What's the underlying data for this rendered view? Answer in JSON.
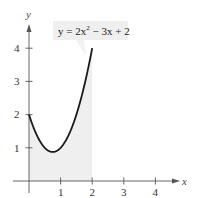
{
  "chart_data": {
    "type": "area",
    "title": "",
    "equation_label": "y = 2x² − 3x + 2",
    "function": "y = 2x^2 - 3x + 2",
    "shaded_region": {
      "x_from": 0,
      "x_to": 2,
      "description": "area under curve from x=0 to x=2"
    },
    "xlabel": "x",
    "ylabel": "y",
    "xlim": [
      0,
      4.6
    ],
    "ylim": [
      0,
      4.5
    ],
    "x_ticks": [
      1,
      2,
      3,
      4
    ],
    "y_ticks": [
      1,
      2,
      3,
      4
    ],
    "grid": false,
    "series": [
      {
        "name": "y = 2x^2 - 3x + 2",
        "x": [
          0,
          0.25,
          0.5,
          0.75,
          1,
          1.25,
          1.5,
          1.75,
          2
        ],
        "y": [
          2,
          1.375,
          1,
          0.875,
          1,
          1.375,
          2,
          2.875,
          4
        ]
      }
    ]
  },
  "labels": {
    "x_axis": "x",
    "y_axis": "y",
    "x_ticks": [
      "1",
      "2",
      "3",
      "4"
    ],
    "y_ticks": [
      "1",
      "2",
      "3",
      "4"
    ],
    "equation_prefix": "y = 2x",
    "equation_exp": "2",
    "equation_suffix": " − 3x + 2"
  },
  "colors": {
    "curve": "#1a1a1a",
    "shade": "#efefef",
    "axis": "#555555",
    "label_box": "#efefef"
  }
}
